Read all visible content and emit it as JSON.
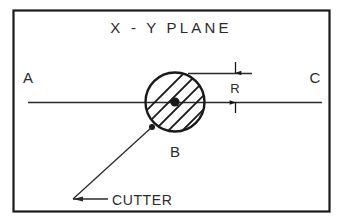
{
  "figure": {
    "title": "X - Y PLANE",
    "kind": "engineering-line-drawing",
    "border_color": "#1a1a1a",
    "line_color": "#2b2b2b",
    "hatch_color": "#1a1a1a",
    "background_color": "#ffffff"
  },
  "labels": {
    "title": "X - Y PLANE",
    "point_a": "A",
    "point_b": "B",
    "point_c": "C",
    "radius_dim": "R",
    "leader_note": "CUTTER"
  },
  "geometry": {
    "frame": {
      "x": 13,
      "y": 10,
      "width": 317,
      "height": 202
    },
    "cutter_circle": {
      "cx": 175,
      "cy": 102,
      "r": 30,
      "hatched": true,
      "hatch_angle_deg": 45
    },
    "center_dot": {
      "cx": 175,
      "cy": 102,
      "r": 4.5
    },
    "centerline": {
      "y": 102,
      "x1": 28,
      "x2": 322
    },
    "tangent_line": {
      "y": 73,
      "x1": 188,
      "x2": 252
    },
    "dimension_R": {
      "x": 235,
      "y_top": 62,
      "y_bottom": 113,
      "value_label": "R"
    },
    "leader": {
      "dot_x": 152,
      "dot_y": 127,
      "elbow_x": 73,
      "elbow_y": 199,
      "tail_x": 108,
      "tail_y": 199
    }
  },
  "annotations": {
    "point_a_pos": {
      "x": 28,
      "y": 78
    },
    "point_b_pos": {
      "x": 175,
      "y": 152
    },
    "point_c_pos": {
      "x": 315,
      "y": 78
    },
    "radius_label_pos": {
      "x": 235,
      "y": 92
    },
    "title_pos": {
      "x": 171,
      "y": 33
    },
    "leader_label_pos": {
      "x": 112,
      "y": 204
    }
  }
}
